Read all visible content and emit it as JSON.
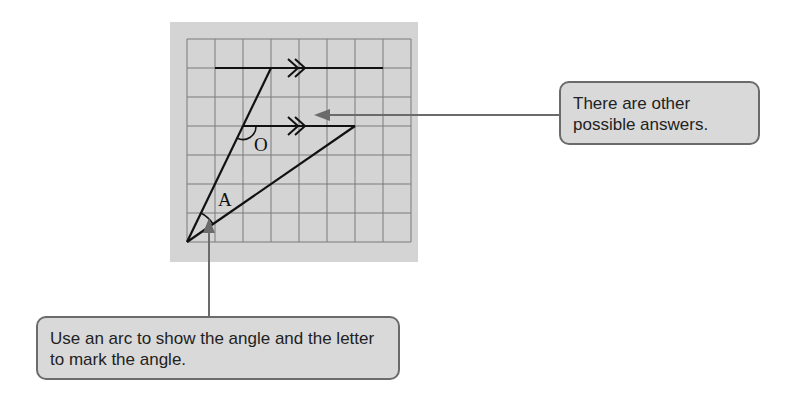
{
  "diagram": {
    "grid": {
      "columns": 8,
      "rows": 7,
      "background": "#d4d4d4",
      "line_color": "#7a7a7a"
    },
    "labels": {
      "angle_o": "O",
      "angle_a": "A"
    },
    "parallel_marker": "double-arrow",
    "pointer_color": "#6b6b6b"
  },
  "callouts": {
    "right": {
      "text": "There are other possible answers."
    },
    "bottom": {
      "text": "Use an arc to show the angle and the letter to mark the angle."
    }
  }
}
